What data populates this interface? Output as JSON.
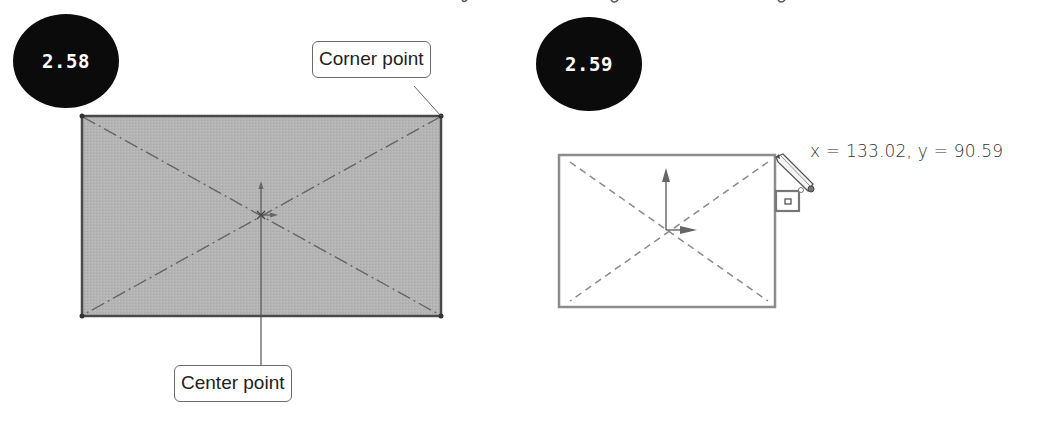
{
  "figures": [
    {
      "id_label": "2.58",
      "callouts": {
        "corner": "Corner point",
        "center": "Center point"
      },
      "rectangle": {
        "fill": "#b4b4b4",
        "stroke": "#4a4a4a",
        "style": "filled",
        "diagonals": "dash-dot"
      }
    },
    {
      "id_label": "2.59",
      "coordinate_readout": "x = 133.02, y = 90.59",
      "rectangle": {
        "fill": "#ffffff",
        "stroke": "#8a8a8a",
        "style": "outline",
        "diagonals": "dashed"
      },
      "cursor_icons": [
        "pencil-icon",
        "rectangle-tool-icon"
      ]
    }
  ],
  "colors": {
    "badge_bg": "#0b0b0b",
    "badge_text": "#ffffff",
    "callout_border": "#6a6a6a"
  }
}
